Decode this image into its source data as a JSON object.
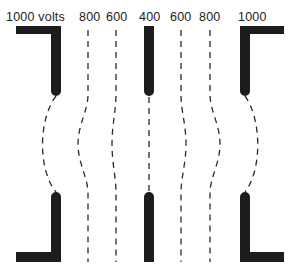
{
  "diagram": {
    "labels": [
      {
        "id": "left-electrode-voltage",
        "text": "1000 volts",
        "x": 6
      },
      {
        "id": "left-800",
        "text": "800",
        "x": 79
      },
      {
        "id": "left-600",
        "text": "600",
        "x": 106
      },
      {
        "id": "center-400",
        "text": "400",
        "x": 139
      },
      {
        "id": "right-600",
        "text": "600",
        "x": 170
      },
      {
        "id": "right-800",
        "text": "800",
        "x": 199
      },
      {
        "id": "right-1000",
        "text": "1000",
        "x": 238
      }
    ],
    "electrodes": [
      {
        "name": "left-electrode",
        "voltage": 1000
      },
      {
        "name": "center-electrode",
        "voltage": 400
      },
      {
        "name": "right-electrode",
        "voltage": 1000
      }
    ],
    "equipotentials": [
      1000,
      800,
      600,
      400,
      600,
      800,
      1000
    ],
    "colors": {
      "electrode": "#1c1c1c",
      "line": "#2a2a2a",
      "text": "#222222"
    }
  }
}
